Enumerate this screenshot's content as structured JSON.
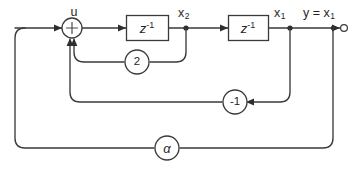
{
  "diagram": {
    "colors": {
      "line": "#3a3a3a",
      "text": "#1f1f1f",
      "background": "#ffffff",
      "node": "#2e2e2e"
    },
    "signals": {
      "input_label": "u",
      "state2_label": "x",
      "state2_sub": "2",
      "state1_label": "x",
      "state1_sub": "1",
      "output_label": "y = x",
      "output_sub": "1"
    },
    "blocks": [
      {
        "id": "delay-1",
        "name": "unit-delay-block-1",
        "text": "z",
        "exponent": "-1"
      },
      {
        "id": "delay-2",
        "name": "unit-delay-block-2",
        "text": "z",
        "exponent": "-1"
      }
    ],
    "summer": {
      "name": "summing-junction",
      "sign": "+"
    },
    "gains": [
      {
        "id": "gain-2",
        "name": "gain-block-2",
        "label": "2",
        "path": "feedback from x2 to summer"
      },
      {
        "id": "gain-neg1",
        "name": "gain-block-minus-1",
        "label": "-1",
        "path": "feedback from x1 to summer"
      },
      {
        "id": "gain-alpha",
        "name": "gain-block-alpha",
        "label": "α",
        "path": "outer feedback from output to input"
      }
    ],
    "terminals": [
      {
        "id": "output-terminal",
        "name": "output-terminal",
        "kind": "open-circle"
      }
    ],
    "nodes": [
      {
        "id": "node-x2",
        "name": "signal-node-x2"
      },
      {
        "id": "node-x1",
        "name": "signal-node-x1"
      },
      {
        "id": "node-output",
        "name": "signal-node-output"
      }
    ]
  }
}
